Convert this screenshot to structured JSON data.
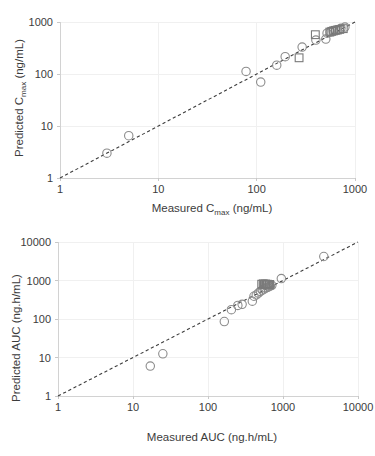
{
  "figure": {
    "panels": [
      "cmax",
      "auc"
    ]
  },
  "chart_data": [
    {
      "id": "cmax",
      "type": "scatter",
      "title": "",
      "xlabel_prefix": "Measured C",
      "xlabel_sub": "max",
      "xlabel_suffix": " (ng/mL)",
      "ylabel_prefix": "Predicted C",
      "ylabel_sub": "max",
      "ylabel_suffix": " (ng/mL)",
      "xscale": "log",
      "yscale": "log",
      "xlim": [
        1,
        1000
      ],
      "ylim": [
        1,
        1000
      ],
      "xticks": [
        1,
        10,
        100,
        1000
      ],
      "xtick_labels": [
        "1",
        "10",
        "100",
        "1000"
      ],
      "yticks": [
        1,
        10,
        100,
        1000
      ],
      "ytick_labels": [
        "1",
        "10",
        "100",
        "1000"
      ],
      "grid": true,
      "legend": "none",
      "reference_line": {
        "style": "dashed",
        "label": "line of identity",
        "from": [
          1,
          1
        ],
        "to": [
          1000,
          1000
        ]
      },
      "series": [
        {
          "name": "circles",
          "marker": "open-circle",
          "points": [
            [
              3.0,
              3.0
            ],
            [
              5.0,
              6.5
            ],
            [
              78,
              112
            ],
            [
              110,
              70
            ],
            [
              160,
              148
            ],
            [
              195,
              215
            ],
            [
              290,
              330
            ],
            [
              400,
              450
            ],
            [
              505,
              470
            ],
            [
              520,
              610
            ],
            [
              560,
              640
            ],
            [
              600,
              680
            ],
            [
              640,
              700
            ],
            [
              690,
              720
            ],
            [
              720,
              760
            ],
            [
              790,
              800
            ]
          ]
        },
        {
          "name": "squares",
          "marker": "open-square",
          "points": [
            [
              270,
              205
            ],
            [
              395,
              570
            ],
            [
              555,
              640
            ],
            [
              580,
              660
            ],
            [
              605,
              675
            ],
            [
              630,
              690
            ],
            [
              660,
              700
            ],
            [
              700,
              720
            ],
            [
              760,
              745
            ]
          ]
        }
      ]
    },
    {
      "id": "auc",
      "type": "scatter",
      "title": "",
      "xlabel": "Measured AUC (ng.h/mL)",
      "ylabel": "Predicted AUC (ng.h/mL)",
      "xscale": "log",
      "yscale": "log",
      "xlim": [
        1,
        10000
      ],
      "ylim": [
        1,
        10000
      ],
      "xticks": [
        1,
        10,
        100,
        1000,
        10000
      ],
      "xtick_labels": [
        "1",
        "10",
        "100",
        "1000",
        "10000"
      ],
      "yticks": [
        1,
        10,
        100,
        1000,
        10000
      ],
      "ytick_labels": [
        "1",
        "10",
        "100",
        "1000",
        "10000"
      ],
      "grid": true,
      "legend": "none",
      "reference_line": {
        "style": "dashed",
        "label": "line of identity",
        "from": [
          1,
          1
        ],
        "to": [
          10000,
          10000
        ]
      },
      "series": [
        {
          "name": "circles",
          "marker": "open-circle",
          "points": [
            [
              17,
              6.0
            ],
            [
              25,
              12.5
            ],
            [
              165,
              86
            ],
            [
              205,
              175
            ],
            [
              250,
              225
            ],
            [
              285,
              240
            ],
            [
              390,
              290
            ],
            [
              410,
              390
            ],
            [
              440,
              420
            ],
            [
              470,
              470
            ],
            [
              500,
              520
            ],
            [
              530,
              560
            ],
            [
              560,
              600
            ],
            [
              590,
              640
            ],
            [
              620,
              660
            ],
            [
              650,
              690
            ],
            [
              680,
              720
            ],
            [
              710,
              750
            ],
            [
              950,
              1120
            ],
            [
              3500,
              4200
            ]
          ]
        },
        {
          "name": "squares",
          "marker": "open-square",
          "points": [
            [
              520,
              800
            ],
            [
              545,
              820
            ],
            [
              565,
              790
            ],
            [
              585,
              810
            ],
            [
              600,
              780
            ],
            [
              620,
              800
            ],
            [
              645,
              770
            ],
            [
              665,
              790
            ]
          ]
        }
      ]
    }
  ]
}
